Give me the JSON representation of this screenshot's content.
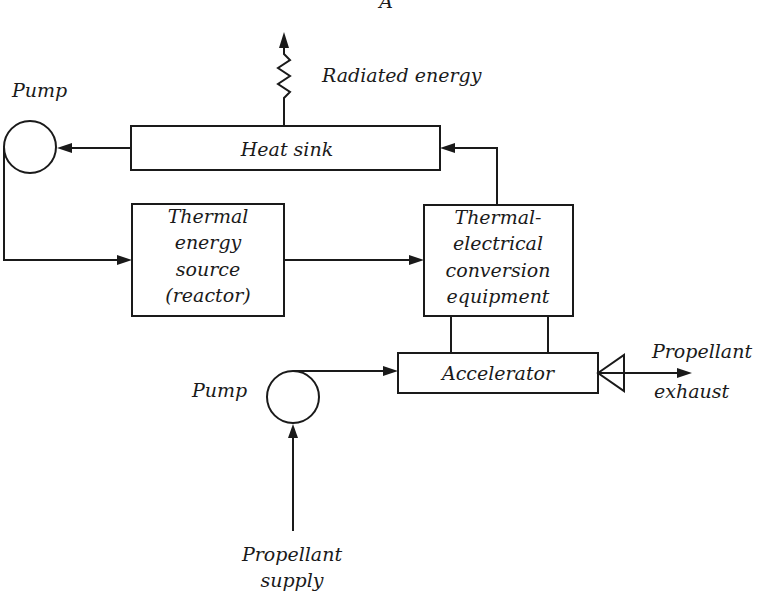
{
  "diagram": {
    "figure_label": "A",
    "nodes": {
      "heat_sink": {
        "lines": [
          "Heat sink"
        ]
      },
      "thermal_source": {
        "lines": [
          "Thermal",
          "energy",
          "source",
          "(reactor)"
        ]
      },
      "conversion": {
        "lines": [
          "Thermal-",
          "electrical",
          "conversion",
          "equipment"
        ]
      },
      "accelerator": {
        "lines": [
          "Accelerator"
        ]
      },
      "pump_top": {
        "label": "Pump"
      },
      "pump_bottom": {
        "label": "Pump"
      }
    },
    "labels": {
      "radiated_energy": "Radiated energy",
      "propellant_exhaust": [
        "Propellant",
        "exhaust"
      ],
      "propellant_supply": [
        "Propellant",
        "supply"
      ]
    },
    "colors": {
      "ink": "#1a1a1a",
      "background": "#ffffff"
    }
  }
}
